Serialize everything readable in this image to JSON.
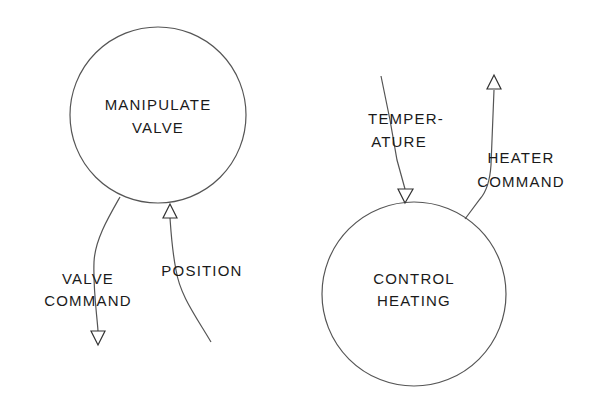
{
  "processes": [
    {
      "id": "manipulate-valve",
      "lines": [
        "MANIPULATE",
        "VALVE"
      ]
    },
    {
      "id": "control-heating",
      "lines": [
        "CONTROL",
        "HEATING"
      ]
    }
  ],
  "flows": [
    {
      "id": "valve-command",
      "lines": [
        "VALVE",
        "COMMAND"
      ],
      "direction": "out-of-manipulate-valve"
    },
    {
      "id": "position",
      "lines": [
        "POSITION"
      ],
      "direction": "into-manipulate-valve"
    },
    {
      "id": "temperature",
      "lines": [
        "TEMPER-",
        "ATURE"
      ],
      "direction": "into-control-heating"
    },
    {
      "id": "heater-command",
      "lines": [
        "HEATER",
        "COMMAND"
      ],
      "direction": "out-of-control-heating"
    }
  ],
  "colors": {
    "line": "#555555",
    "text": "#1a1a1a",
    "background": "#ffffff"
  }
}
